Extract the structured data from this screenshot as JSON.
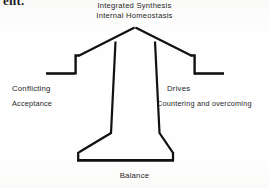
{
  "figure": {
    "type": "concept-diagram",
    "shape_name": "anvil-arrow",
    "stroke_color": "#111111",
    "background_color": "#fefefe",
    "top_remnant_text": "ent.",
    "labels": {
      "top_line1": "Integrated Synthesis",
      "top_line2": "Internal Homeostasis",
      "left_title": "Conflicting",
      "left_sub": "Acceptance",
      "right_title": "Drives",
      "right_sub": "Countering and overcoming",
      "bottom": "Balance"
    },
    "geometry": {
      "apex": [
        135,
        28
      ],
      "left_arm_outer_end": [
        46,
        74
      ],
      "right_arm_outer_end": [
        224,
        74
      ],
      "left_shoulder": [
        78,
        54
      ],
      "right_shoulder": [
        192,
        54
      ],
      "stem_left_top": [
        114,
        41
      ],
      "stem_right_top": [
        156,
        41
      ],
      "stem_left_bottom": [
        110,
        133
      ],
      "stem_right_bottom": [
        160,
        133
      ],
      "base_left_top": [
        78,
        152
      ],
      "base_right_top": [
        173,
        152
      ],
      "base_left_bottom": [
        78,
        161
      ],
      "base_right_bottom": [
        173,
        161
      ]
    }
  }
}
